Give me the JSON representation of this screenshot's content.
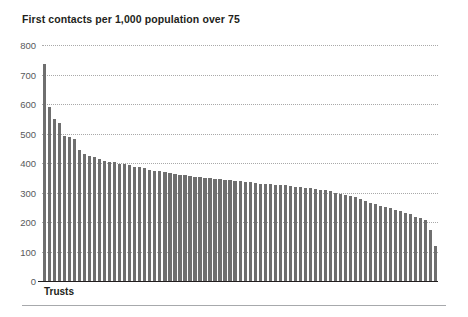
{
  "chart_data": {
    "type": "bar",
    "title": "First contacts per 1,000 population over 75",
    "xlabel": "Trusts",
    "ylabel": "",
    "ylim": [
      0,
      800
    ],
    "ytick_labels": [
      "800",
      "700",
      "600",
      "500",
      "400",
      "300",
      "200",
      "100",
      "0"
    ],
    "yticks": [
      800,
      700,
      600,
      500,
      400,
      300,
      200,
      100,
      0
    ],
    "grid": true,
    "legend": null,
    "categories": [
      "Trust 1",
      "Trust 2",
      "Trust 3",
      "Trust 4",
      "Trust 5",
      "Trust 6",
      "Trust 7",
      "Trust 8",
      "Trust 9",
      "Trust 10",
      "Trust 11",
      "Trust 12",
      "Trust 13",
      "Trust 14",
      "Trust 15",
      "Trust 16",
      "Trust 17",
      "Trust 18",
      "Trust 19",
      "Trust 20",
      "Trust 21",
      "Trust 22",
      "Trust 23",
      "Trust 24",
      "Trust 25",
      "Trust 26",
      "Trust 27",
      "Trust 28",
      "Trust 29",
      "Trust 30",
      "Trust 31",
      "Trust 32",
      "Trust 33",
      "Trust 34",
      "Trust 35",
      "Trust 36",
      "Trust 37",
      "Trust 38",
      "Trust 39",
      "Trust 40",
      "Trust 41",
      "Trust 42",
      "Trust 43",
      "Trust 44",
      "Trust 45",
      "Trust 46",
      "Trust 47",
      "Trust 48",
      "Trust 49",
      "Trust 50",
      "Trust 51",
      "Trust 52",
      "Trust 53",
      "Trust 54",
      "Trust 55",
      "Trust 56",
      "Trust 57",
      "Trust 58",
      "Trust 59",
      "Trust 60",
      "Trust 61",
      "Trust 62",
      "Trust 63",
      "Trust 64",
      "Trust 65",
      "Trust 66",
      "Trust 67",
      "Trust 68",
      "Trust 69",
      "Trust 70",
      "Trust 71",
      "Trust 72",
      "Trust 73",
      "Trust 74",
      "Trust 75",
      "Trust 76",
      "Trust 77",
      "Trust 78",
      "Trust 79"
    ],
    "values": [
      735,
      590,
      548,
      535,
      492,
      487,
      480,
      445,
      432,
      425,
      420,
      412,
      408,
      405,
      402,
      398,
      395,
      392,
      388,
      385,
      382,
      378,
      374,
      372,
      368,
      366,
      362,
      360,
      358,
      356,
      354,
      352,
      350,
      348,
      346,
      345,
      344,
      342,
      340,
      338,
      336,
      334,
      332,
      330,
      329,
      328,
      326,
      325,
      324,
      322,
      320,
      318,
      316,
      314,
      312,
      310,
      308,
      305,
      300,
      296,
      292,
      288,
      284,
      278,
      272,
      266,
      260,
      255,
      250,
      246,
      242,
      238,
      232,
      226,
      218,
      212,
      206,
      172,
      120
    ],
    "bar_color": "#6f6f6f",
    "grid_color": "#a9a9a9",
    "axis_color": "#231f20",
    "background": "#ffffff"
  }
}
